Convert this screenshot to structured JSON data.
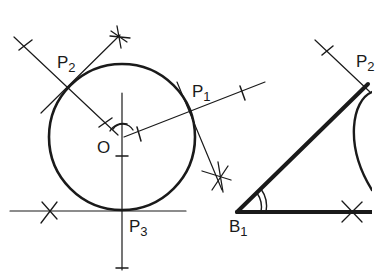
{
  "figure": {
    "colors": {
      "ink": "#1a1a1a",
      "background": "#ffffff"
    }
  },
  "labels": {
    "p2_left": {
      "base": "P",
      "sub": "2"
    },
    "p1": {
      "base": "P",
      "sub": "1"
    },
    "o": {
      "base": "O"
    },
    "p3": {
      "base": "P",
      "sub": "3"
    },
    "b1": {
      "base": "B",
      "sub": "1"
    },
    "p2_right": {
      "base": "P",
      "sub": "2"
    }
  }
}
